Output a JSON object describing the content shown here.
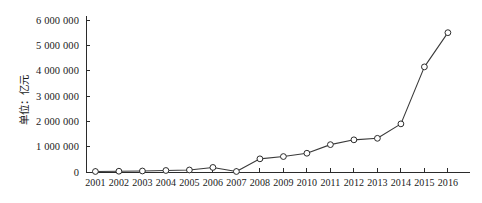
{
  "chart_data": {
    "type": "line",
    "title": "",
    "subtitle": "",
    "xlabel": "",
    "ylabel": "单位：亿元",
    "categories": [
      "2001",
      "2002",
      "2003",
      "2004",
      "2005",
      "2006",
      "2007",
      "2008",
      "2009",
      "2010",
      "2011",
      "2012",
      "2013",
      "2014",
      "2015",
      "2016"
    ],
    "x": [
      2001,
      2002,
      2003,
      2004,
      2005,
      2006,
      2007,
      2008,
      2009,
      2010,
      2011,
      2012,
      2013,
      2014,
      2015,
      2016
    ],
    "values": [
      20000,
      30000,
      40000,
      60000,
      80000,
      180000,
      20000,
      520000,
      610000,
      740000,
      1080000,
      1270000,
      1330000,
      1900000,
      4150000,
      5500000
    ],
    "ylim": [
      0,
      6000000
    ],
    "xlim": [
      2000.6,
      2016.6
    ],
    "yticks": [
      0,
      1000000,
      2000000,
      3000000,
      4000000,
      5000000,
      6000000
    ],
    "ytick_labels": [
      "0",
      "1 000 000",
      "2 000 000",
      "3 000 000",
      "4 000 000",
      "5 000 000",
      "6 000 000"
    ],
    "xtick_labels": [
      "2001",
      "2002",
      "2003",
      "2004",
      "2005",
      "2006",
      "2007",
      "2008",
      "2009",
      "2010",
      "2011",
      "2012",
      "2013",
      "2014",
      "2015",
      "2016"
    ],
    "grid": false,
    "legend": null,
    "legend_position": "none",
    "marker": "open-circle",
    "line_color": "#3a3a3a",
    "marker_face_color": "#ffffff",
    "marker_edge_color": "#2b2b2b",
    "axis_color": "#2b2b2b",
    "background_color": "#ffffff",
    "spines": [
      "left",
      "bottom"
    ],
    "tick_direction": "in"
  }
}
